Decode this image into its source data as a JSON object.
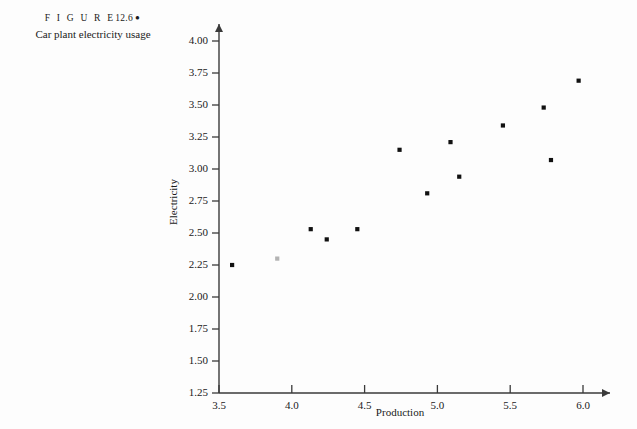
{
  "figure": {
    "label_word": "F I G U R E",
    "number": "12.6",
    "marker": "●",
    "caption": "Car plant electricity usage"
  },
  "colors": {
    "background": "#fdfdfd",
    "ink": "#1a1a1a",
    "axis": "#3a3a3a",
    "marker": "#111111"
  },
  "chart_data": {
    "type": "scatter",
    "title": "Car plant electricity usage",
    "xlabel": "Production",
    "ylabel": "Electricity",
    "xlim": [
      3.5,
      6.05
    ],
    "ylim": [
      1.25,
      4.05
    ],
    "xticks": [
      "3.5",
      "4.0",
      "4.5",
      "5.0",
      "5.5",
      "6.0"
    ],
    "xtick_values": [
      3.5,
      4.0,
      4.5,
      5.0,
      5.5,
      6.0
    ],
    "yticks": [
      "1.25",
      "1.50",
      "1.75",
      "2.00",
      "2.25",
      "2.50",
      "2.75",
      "3.00",
      "3.25",
      "3.50",
      "3.75",
      "4.00"
    ],
    "ytick_values": [
      1.25,
      1.5,
      1.75,
      2.0,
      2.25,
      2.5,
      2.75,
      3.0,
      3.25,
      3.5,
      3.75,
      4.0
    ],
    "grid": false,
    "legend": false,
    "n_points": 14,
    "points": [
      {
        "x": 3.59,
        "y": 2.25
      },
      {
        "x": 3.9,
        "y": 2.3
      },
      {
        "x": 4.13,
        "y": 2.53
      },
      {
        "x": 4.24,
        "y": 2.45
      },
      {
        "x": 4.45,
        "y": 2.53
      },
      {
        "x": 4.74,
        "y": 3.15
      },
      {
        "x": 4.93,
        "y": 2.81
      },
      {
        "x": 5.09,
        "y": 3.21
      },
      {
        "x": 5.15,
        "y": 2.94
      },
      {
        "x": 5.45,
        "y": 3.34
      },
      {
        "x": 5.73,
        "y": 3.48
      },
      {
        "x": 5.78,
        "y": 3.07
      },
      {
        "x": 5.97,
        "y": 3.69
      },
      {
        "x": 4.45,
        "y": 2.53
      }
    ]
  }
}
